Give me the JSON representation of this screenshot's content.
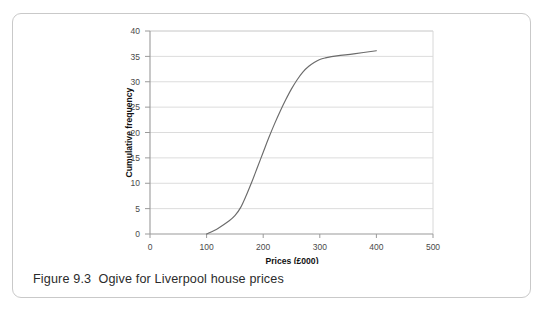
{
  "figure": {
    "caption": "Figure 9.3  Ogive for Liverpool house prices",
    "caption_number": "Figure 9.3",
    "caption_text": "Ogive for Liverpool house prices"
  },
  "colors": {
    "card_border": "#c9c9c9",
    "axis_line": "#9a9a9a",
    "gridline": "#dcdcdc",
    "curve": "#6b6b6b",
    "tick_label": "#4a4a4a",
    "axis_title": "#111111",
    "caption": "#2b2b2b",
    "background": "#ffffff"
  },
  "chart_data": {
    "type": "line",
    "title": "",
    "subtitle": "",
    "xlabel": "Prices (£000)",
    "ylabel": "Cumulative frequency",
    "xlim": [
      0,
      500
    ],
    "ylim": [
      0,
      40
    ],
    "xticks": [
      0,
      100,
      200,
      300,
      400,
      500
    ],
    "yticks": [
      0,
      5,
      10,
      15,
      20,
      25,
      30,
      35,
      40
    ],
    "xtick_labels": [
      "0",
      "100",
      "200",
      "300",
      "400",
      "500"
    ],
    "ytick_labels": [
      "0",
      "5",
      "10",
      "15",
      "20",
      "25",
      "30",
      "35",
      "40"
    ],
    "grid": {
      "horizontal": true,
      "vertical": false
    },
    "legend": {
      "visible": false,
      "position": "none"
    },
    "series": [
      {
        "name": "Cumulative frequency",
        "x": [
          100,
          120,
          140,
          150,
          160,
          170,
          180,
          190,
          200,
          210,
          220,
          230,
          240,
          250,
          260,
          270,
          280,
          290,
          300,
          310,
          330,
          360,
          400
        ],
        "values": [
          0,
          1.1,
          2.6,
          3.6,
          5.2,
          7.6,
          10.3,
          13.2,
          16.1,
          19.0,
          21.7,
          24.2,
          26.5,
          28.6,
          30.4,
          31.9,
          33.0,
          33.8,
          34.4,
          34.7,
          35.1,
          35.5,
          36.1
        ]
      }
    ],
    "annotations": []
  }
}
